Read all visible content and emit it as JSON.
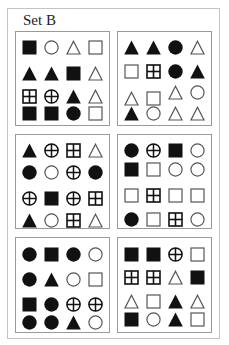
{
  "title": "Set B",
  "colors": {
    "ink": "#111111",
    "outline": "#555555",
    "border": "#9a9a9a"
  },
  "legend": {
    "sq-f": "filled-square",
    "sq-o": "open-square",
    "sq-x": "square-with-cross",
    "ci-f": "filled-circle",
    "ci-o": "open-circle",
    "ci-x": "circle-with-cross",
    "tr-f": "filled-triangle",
    "tr-o": "open-triangle"
  },
  "panels": [
    {
      "id": "panel-1",
      "left": 15,
      "top": 31,
      "height": 95,
      "rows": [
        [
          "sq-f",
          "ci-o",
          "tr-o",
          "sq-o"
        ],
        [
          "tr-f",
          "tr-f",
          "sq-f",
          "tr-o"
        ],
        [
          "sq-x",
          "ci-x",
          "tr-f",
          "tr-o"
        ],
        [
          "sq-f",
          "sq-f",
          "ci-f",
          "sq-o"
        ]
      ],
      "row_y": [
        8,
        34,
        57,
        74
      ]
    },
    {
      "id": "panel-2",
      "left": 117,
      "top": 31,
      "height": 95,
      "rows": [
        [
          "tr-f",
          "tr-f",
          "ci-f",
          "tr-o"
        ],
        [
          "sq-o",
          "sq-x",
          "ci-f",
          "tr-f"
        ],
        [
          "tr-o",
          "sq-o",
          "tr-o",
          "ci-o"
        ],
        [
          "tr-f",
          "ci-o",
          "tr-o",
          "tr-o"
        ]
      ],
      "row_y": [
        8,
        32,
        55,
        74
      ],
      "row_jitter": [
        [
          0,
          0,
          0,
          0
        ],
        [
          0,
          0,
          0,
          0
        ],
        [
          4,
          4,
          -2,
          -2
        ],
        [
          0,
          0,
          0,
          0
        ]
      ]
    },
    {
      "id": "panel-3",
      "left": 15,
      "top": 134,
      "height": 95,
      "rows": [
        [
          "tr-f",
          "ci-x",
          "sq-x",
          "tr-o"
        ],
        [
          "ci-f",
          "ci-o",
          "ci-x",
          "ci-f"
        ],
        [
          "ci-x",
          "sq-f",
          "ci-x",
          "sq-x"
        ],
        [
          "tr-f",
          "ci-o",
          "sq-x",
          "tr-o"
        ]
      ],
      "row_y": [
        8,
        30,
        56,
        78
      ]
    },
    {
      "id": "panel-4",
      "left": 117,
      "top": 134,
      "height": 95,
      "rows": [
        [
          "ci-f",
          "ci-x",
          "sq-f",
          "ci-o"
        ],
        [
          "sq-f",
          "sq-o",
          "ci-o",
          "ci-o"
        ],
        [
          "sq-o",
          "sq-x",
          "sq-o",
          "sq-o"
        ],
        [
          "ci-f",
          "sq-o",
          "sq-x",
          "ci-o"
        ]
      ],
      "row_y": [
        8,
        27,
        53,
        77
      ]
    },
    {
      "id": "panel-5",
      "left": 15,
      "top": 237,
      "height": 96,
      "rows": [
        [
          "ci-f",
          "sq-f",
          "ci-f",
          "ci-o"
        ],
        [
          "ci-f",
          "tr-f",
          "ci-o",
          "sq-o"
        ],
        [
          "sq-f",
          "ci-f",
          "ci-x",
          "ci-x"
        ],
        [
          "ci-f",
          "ci-f",
          "tr-f",
          "ci-o"
        ]
      ],
      "row_y": [
        9,
        34,
        59,
        77
      ]
    },
    {
      "id": "panel-6",
      "left": 117,
      "top": 237,
      "height": 96,
      "rows": [
        [
          "sq-f",
          "sq-f",
          "ci-x",
          "sq-o"
        ],
        [
          "sq-x",
          "sq-x",
          "tr-o",
          "sq-f"
        ],
        [
          "tr-o",
          "sq-o",
          "tr-f",
          "tr-o"
        ],
        [
          "sq-f",
          "ci-o",
          "tr-f",
          "sq-o"
        ]
      ],
      "row_y": [
        9,
        32,
        56,
        74
      ]
    }
  ],
  "col_x": [
    6,
    28,
    50,
    72
  ]
}
